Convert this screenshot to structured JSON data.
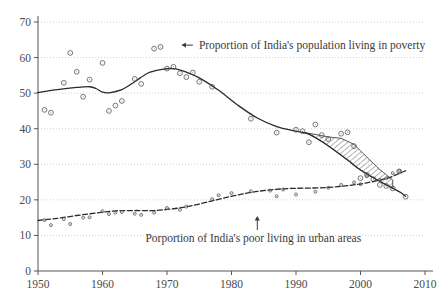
{
  "chart_data": {
    "type": "scatter",
    "title": "",
    "subtitle": "",
    "xlabel": "",
    "ylabel": "",
    "xlim": [
      1950,
      2010
    ],
    "ylim": [
      0,
      70
    ],
    "xticks": [
      1950,
      1960,
      1970,
      1980,
      1990,
      2000,
      2010
    ],
    "yticks": [
      0,
      10,
      20,
      30,
      40,
      50,
      60,
      70
    ],
    "grid": "horizontal-dotted",
    "legend": "none",
    "annotations": [
      {
        "name": "poverty-annotation",
        "text": "Proportion of India's population living in poverty",
        "arrow": "left-arrow",
        "x": 1972,
        "y": 63.5
      },
      {
        "name": "urban-annotation",
        "text": "Porportion of India's poor living in urban areas",
        "arrow": "up-arrow",
        "x": 1984,
        "y": 11.5
      }
    ],
    "shaded_region": {
      "name": "hatched-band",
      "style": "diagonal-hatch",
      "x_start": 1991,
      "x_end": 2005,
      "description": "hatched band between upper and lower poverty trend estimates"
    },
    "series": [
      {
        "name": "Proportion of India's population living in poverty",
        "marker": "open-circle",
        "line": "solid",
        "points": [
          [
            1951,
            45.3
          ],
          [
            1952,
            44.5
          ],
          [
            1954,
            52.9
          ],
          [
            1955,
            61.3
          ],
          [
            1956,
            56.0
          ],
          [
            1957,
            49.0
          ],
          [
            1958,
            53.8
          ],
          [
            1960,
            58.5
          ],
          [
            1961,
            45.0
          ],
          [
            1962,
            46.5
          ],
          [
            1963,
            47.8
          ],
          [
            1965,
            54.0
          ],
          [
            1966,
            52.6
          ],
          [
            1968,
            62.5
          ],
          [
            1969,
            63.0
          ],
          [
            1970,
            56.9
          ],
          [
            1971,
            57.4
          ],
          [
            1972,
            55.6
          ],
          [
            1973,
            54.5
          ],
          [
            1974,
            55.8
          ],
          [
            1975,
            53.2
          ],
          [
            1977,
            51.8
          ],
          [
            1983,
            42.8
          ],
          [
            1987,
            38.9
          ],
          [
            1990,
            39.7
          ],
          [
            1991,
            39.3
          ],
          [
            1992,
            36.2
          ],
          [
            1993,
            41.2
          ],
          [
            1994,
            38.2
          ],
          [
            1995,
            37.1
          ],
          [
            1997,
            38.6
          ],
          [
            1998,
            39.0
          ],
          [
            1999,
            35.1
          ],
          [
            2000,
            26.1
          ],
          [
            2001,
            27.0
          ],
          [
            2002,
            25.8
          ],
          [
            2003,
            24.2
          ],
          [
            2004,
            23.9
          ],
          [
            2005,
            23.2
          ],
          [
            2006,
            28.0
          ],
          [
            2007,
            20.9
          ]
        ],
        "fitted_curve": [
          [
            1950,
            50.2
          ],
          [
            1953,
            51.0
          ],
          [
            1956,
            51.6
          ],
          [
            1958,
            51.8
          ],
          [
            1959,
            51.3
          ],
          [
            1960,
            50.3
          ],
          [
            1961,
            50.1
          ],
          [
            1963,
            51.0
          ],
          [
            1965,
            53.2
          ],
          [
            1967,
            55.6
          ],
          [
            1969,
            56.6
          ],
          [
            1971,
            56.9
          ],
          [
            1973,
            55.9
          ],
          [
            1975,
            54.3
          ],
          [
            1978,
            50.8
          ],
          [
            1981,
            46.6
          ],
          [
            1984,
            43.0
          ],
          [
            1987,
            40.6
          ],
          [
            1990,
            39.3
          ],
          [
            1992,
            38.5
          ],
          [
            1994,
            36.4
          ],
          [
            1996,
            33.9
          ],
          [
            1998,
            31.2
          ],
          [
            2000,
            28.4
          ],
          [
            2002,
            26.2
          ],
          [
            2004,
            24.2
          ],
          [
            2006,
            22.3
          ],
          [
            2007,
            21.0
          ]
        ],
        "upper_band": [
          [
            1991,
            39.0
          ],
          [
            1993,
            38.4
          ],
          [
            1995,
            37.7
          ],
          [
            1997,
            37.3
          ],
          [
            1999,
            35.6
          ],
          [
            2001,
            32.0
          ],
          [
            2003,
            28.5
          ],
          [
            2005,
            25.6
          ]
        ]
      },
      {
        "name": "Porportion of India's poor living in urban areas",
        "marker": "small-open-circle",
        "line": "dashed",
        "points": [
          [
            1951,
            14.3
          ],
          [
            1952,
            12.9
          ],
          [
            1954,
            14.6
          ],
          [
            1955,
            13.2
          ],
          [
            1957,
            15.0
          ],
          [
            1958,
            15.1
          ],
          [
            1960,
            16.8
          ],
          [
            1961,
            16.0
          ],
          [
            1962,
            16.4
          ],
          [
            1963,
            16.6
          ],
          [
            1965,
            16.1
          ],
          [
            1966,
            15.8
          ],
          [
            1968,
            16.4
          ],
          [
            1970,
            17.7
          ],
          [
            1972,
            17.2
          ],
          [
            1973,
            18.1
          ],
          [
            1977,
            20.2
          ],
          [
            1978,
            21.3
          ],
          [
            1980,
            21.9
          ],
          [
            1983,
            22.4
          ],
          [
            1986,
            22.6
          ],
          [
            1987,
            21.0
          ],
          [
            1988,
            22.9
          ],
          [
            1990,
            21.5
          ],
          [
            1993,
            22.3
          ],
          [
            1995,
            23.4
          ],
          [
            1997,
            24.2
          ],
          [
            1999,
            24.9
          ],
          [
            2000,
            24.4
          ],
          [
            2001,
            26.7
          ],
          [
            2003,
            25.6
          ],
          [
            2004,
            26.1
          ],
          [
            2005,
            27.5
          ],
          [
            2006,
            28.1
          ]
        ],
        "fitted_curve": [
          [
            1950,
            14.2
          ],
          [
            1953,
            14.8
          ],
          [
            1956,
            15.6
          ],
          [
            1959,
            16.3
          ],
          [
            1962,
            16.9
          ],
          [
            1965,
            17.0
          ],
          [
            1968,
            17.0
          ],
          [
            1971,
            17.5
          ],
          [
            1974,
            18.4
          ],
          [
            1977,
            19.7
          ],
          [
            1980,
            21.0
          ],
          [
            1983,
            22.1
          ],
          [
            1986,
            22.8
          ],
          [
            1989,
            23.2
          ],
          [
            1992,
            23.3
          ],
          [
            1995,
            23.5
          ],
          [
            1998,
            24.0
          ],
          [
            2001,
            24.8
          ],
          [
            2004,
            26.0
          ],
          [
            2006,
            27.4
          ],
          [
            2007,
            28.2
          ]
        ]
      }
    ]
  },
  "axis": {
    "x_tick_labels": [
      "1950",
      "1960",
      "1970",
      "1980",
      "1990",
      "2000",
      "2010"
    ],
    "y_tick_labels": [
      "0",
      "10",
      "20",
      "30",
      "40",
      "50",
      "60",
      "70"
    ]
  },
  "colors": {
    "line": "#2a2a2a",
    "marker_stroke": "#555555",
    "grid": "#bbbbbb",
    "axis": "#555555",
    "text": "#3a3a3a",
    "background": "#ffffff"
  }
}
